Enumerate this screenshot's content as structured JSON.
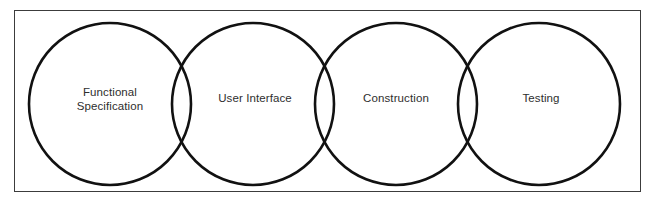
{
  "diagram": {
    "type": "venn-chain",
    "title": "",
    "frame": {
      "stroke_color": "#3c3c3c",
      "fill_color": "#ffffff"
    },
    "circle_style": {
      "stroke_color": "#111111",
      "fill_color": "none",
      "radius": 81
    },
    "label_color": "#2e2e2e",
    "circles": [
      {
        "id": "functional-specification",
        "label": "Functional\nSpecification",
        "cx": 110,
        "cy": 104,
        "label_x": 110,
        "label_y": 99
      },
      {
        "id": "user-interface",
        "label": "User Interface",
        "cx": 253,
        "cy": 104,
        "label_x": 255,
        "label_y": 99
      },
      {
        "id": "construction",
        "label": "Construction",
        "cx": 396,
        "cy": 104,
        "label_x": 396,
        "label_y": 99
      },
      {
        "id": "testing",
        "label": "Testing",
        "cx": 539,
        "cy": 104,
        "label_x": 541,
        "label_y": 99
      }
    ]
  }
}
